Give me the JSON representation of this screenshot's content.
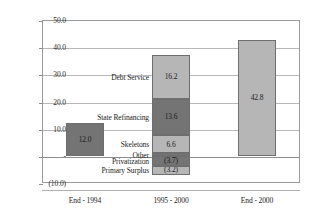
{
  "chart_data": {
    "type": "bar",
    "title": "",
    "xlabel": "",
    "ylabel": "",
    "ylim": [
      -10,
      50
    ],
    "grid": true,
    "legend_position": "none",
    "categories": [
      "End - 1994",
      "1995 - 2000",
      "End - 2000"
    ],
    "y_ticks": [
      {
        "value": 50,
        "label": "50.0"
      },
      {
        "value": 40,
        "label": "40.0"
      },
      {
        "value": 30,
        "label": "30.0"
      },
      {
        "value": 20,
        "label": "20.0"
      },
      {
        "value": 10,
        "label": "10.0"
      },
      {
        "value": 0,
        "label": "-"
      },
      {
        "value": -10,
        "label": "(10.0)"
      }
    ],
    "bars": [
      {
        "category": "End - 1994",
        "total": 12.0,
        "segments": [
          {
            "name": "End - 1994",
            "value": 12.0,
            "label": "12.0",
            "color": "#747474",
            "shade": "dark",
            "callout": ""
          }
        ]
      },
      {
        "category": "1995 - 2000",
        "total": 35.5,
        "segments": [
          {
            "name": "Other",
            "value": 0.9,
            "label": "",
            "color": "#747474",
            "shade": "dark",
            "callout": "Other"
          },
          {
            "name": "Skeletons",
            "value": 6.6,
            "label": "6.6",
            "color": "#b6b6b6",
            "shade": "light",
            "callout": "Skeletons"
          },
          {
            "name": "State Refinancing",
            "value": 13.6,
            "label": "13.6",
            "color": "#747474",
            "shade": "dark",
            "callout": "State Refinancing"
          },
          {
            "name": "Debt Service",
            "value": 16.2,
            "label": "16.2",
            "color": "#b6b6b6",
            "shade": "light",
            "callout": "Debt Service"
          },
          {
            "name": "Privatization",
            "value": -3.7,
            "label": "(3.7)",
            "color": "#747474",
            "shade": "dark",
            "callout": "Privatization"
          },
          {
            "name": "Primary Surplus",
            "value": -3.2,
            "label": "(3.2)",
            "color": "#b6b6b6",
            "shade": "light",
            "callout": "Primary Surplus"
          }
        ]
      },
      {
        "category": "End - 2000",
        "total": 42.8,
        "segments": [
          {
            "name": "End - 2000",
            "value": 42.8,
            "label": "42.8",
            "color": "#b6b6b6",
            "shade": "light",
            "callout": ""
          }
        ]
      }
    ]
  }
}
